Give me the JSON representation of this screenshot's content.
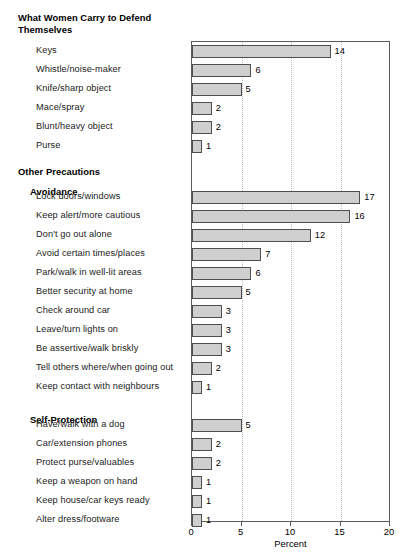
{
  "chart_data": {
    "type": "bar",
    "orientation": "horizontal",
    "xlabel": "Percent",
    "ylabel": "",
    "xlim": [
      0,
      20
    ],
    "xticks": [
      0,
      5,
      10,
      15,
      20
    ],
    "grid": "vertical-dotted",
    "legend": "none",
    "bar_color": "#cfcfcf",
    "bar_border_color": "#4f4f4f",
    "sections": [
      {
        "heading": "What Women Carry to Defend Themselves",
        "heading_level": 0,
        "categories": [
          "Keys",
          "Whistle/noise-maker",
          "Knife/sharp object",
          "Mace/spray",
          "Blunt/heavy object",
          "Purse"
        ],
        "values": [
          14,
          6,
          5,
          2,
          2,
          1
        ]
      },
      {
        "heading": "Other Precautions",
        "heading_level": 0,
        "categories": [],
        "values": []
      },
      {
        "heading": "Avoidance",
        "heading_level": 1,
        "categories": [
          "Lock doors/windows",
          "Keep alert/more cautious",
          "Don't go out alone",
          "Avoid certain times/places",
          "Park/walk in well-lit areas",
          "Better security at home",
          "Check around car",
          "Leave/turn lights on",
          "Be assertive/walk briskly",
          "Tell others where/when going out",
          "Keep contact with neighbours"
        ],
        "values": [
          17,
          16,
          12,
          7,
          6,
          5,
          3,
          3,
          3,
          2,
          1
        ]
      },
      {
        "heading": "Self-Protection",
        "heading_level": 1,
        "categories": [
          "Have/walk with a dog",
          "Car/extension phones",
          "Protect purse/valuables",
          "Keep a weapon on hand",
          "Keep house/car keys ready",
          "Alter dress/footware"
        ],
        "values": [
          5,
          2,
          2,
          1,
          1,
          1
        ]
      }
    ],
    "categories": [
      "Keys",
      "Whistle/noise-maker",
      "Knife/sharp object",
      "Mace/spray",
      "Blunt/heavy object",
      "Purse",
      "Lock doors/windows",
      "Keep alert/more cautious",
      "Don't go out alone",
      "Avoid certain times/places",
      "Park/walk in well-lit areas",
      "Better security at home",
      "Check around car",
      "Leave/turn lights on",
      "Be assertive/walk briskly",
      "Tell others where/when going out",
      "Keep contact with neighbours",
      "Have/walk with a dog",
      "Car/extension phones",
      "Protect purse/valuables",
      "Keep a weapon on hand",
      "Keep house/car keys ready",
      "Alter dress/footware"
    ],
    "values": [
      14,
      6,
      5,
      2,
      2,
      1,
      17,
      16,
      12,
      7,
      6,
      5,
      3,
      3,
      3,
      2,
      1,
      5,
      2,
      2,
      1,
      1,
      1
    ]
  },
  "layout": {
    "title_line_1": "What Women Carry to Defend",
    "title_line_2": "Themselves",
    "heading_other_precautions": "Other Precautions",
    "heading_avoidance": "Avoidance",
    "heading_self_protection": "Self-Protection",
    "axis_title": "Percent"
  }
}
